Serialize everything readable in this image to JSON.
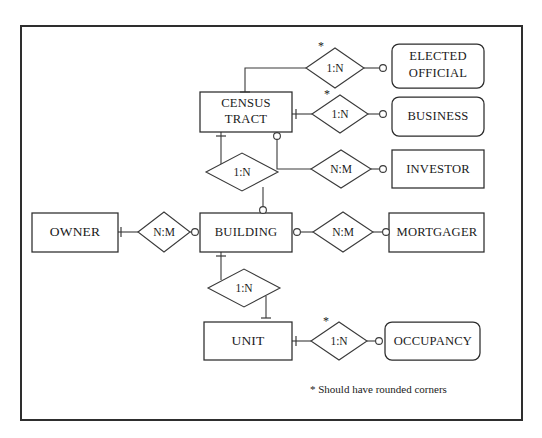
{
  "diagram": {
    "footnote": "* Should have rounded corners",
    "asterisk": "*",
    "colors": {
      "frame": "#2e2e2e",
      "entity_stroke": "#2b2b2b",
      "relation_stroke": "#3a3a3a",
      "background": "#ffffff",
      "text": "#1a1a1a"
    },
    "entities": [
      {
        "id": "census-tract",
        "label_line1": "CENSUS",
        "label_line2": "TRACT",
        "corners": "square"
      },
      {
        "id": "elected-official",
        "label_line1": "ELECTED",
        "label_line2": "OFFICIAL",
        "corners": "rounded"
      },
      {
        "id": "business",
        "label_line1": "BUSINESS",
        "label_line2": "",
        "corners": "rounded"
      },
      {
        "id": "investor",
        "label_line1": "INVESTOR",
        "label_line2": "",
        "corners": "square"
      },
      {
        "id": "owner",
        "label_line1": "OWNER",
        "label_line2": "",
        "corners": "square"
      },
      {
        "id": "building",
        "label_line1": "BUILDING",
        "label_line2": "",
        "corners": "square"
      },
      {
        "id": "mortgager",
        "label_line1": "MORTGAGER",
        "label_line2": "",
        "corners": "square"
      },
      {
        "id": "unit",
        "label_line1": "UNIT",
        "label_line2": "",
        "corners": "square"
      },
      {
        "id": "occupancy",
        "label_line1": "OCCUPANCY",
        "label_line2": "",
        "corners": "rounded"
      }
    ],
    "relationships": [
      {
        "id": "ct-elected-official",
        "cardinality": "1:N",
        "from": "census-tract",
        "to": "elected-official",
        "starred": true
      },
      {
        "id": "ct-business",
        "cardinality": "1:N",
        "from": "census-tract",
        "to": "business",
        "starred": true
      },
      {
        "id": "ct-investor",
        "cardinality": "N:M",
        "from": "census-tract",
        "to": "investor",
        "starred": false
      },
      {
        "id": "ct-building",
        "cardinality": "1:N",
        "from": "census-tract",
        "to": "building",
        "starred": false
      },
      {
        "id": "owner-building",
        "cardinality": "N:M",
        "from": "owner",
        "to": "building",
        "starred": false
      },
      {
        "id": "building-mortgager",
        "cardinality": "N:M",
        "from": "building",
        "to": "mortgager",
        "starred": false
      },
      {
        "id": "building-unit",
        "cardinality": "1:N",
        "from": "building",
        "to": "unit",
        "starred": false
      },
      {
        "id": "unit-occupancy",
        "cardinality": "1:N",
        "from": "unit",
        "to": "occupancy",
        "starred": true
      }
    ]
  }
}
